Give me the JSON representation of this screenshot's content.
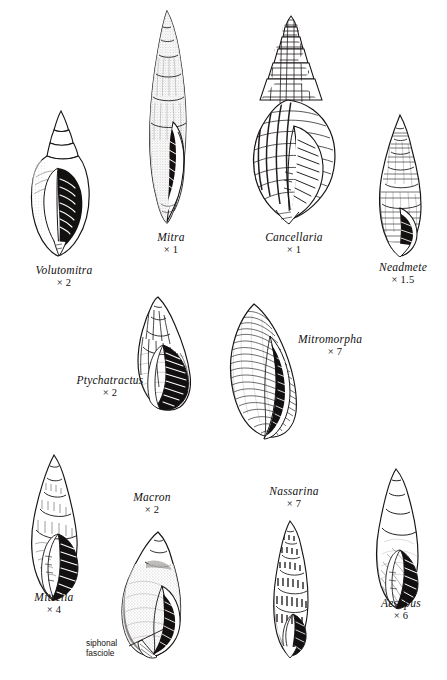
{
  "plate": {
    "title": "Gastropod shell plate",
    "background_color": "#ffffff",
    "ink_color": "#121010",
    "specimens": [
      {
        "genus": "Volutomitra",
        "magnification": "× 2",
        "caption_genus": "Volutomitra",
        "caption_mag": "× 2"
      },
      {
        "genus": "Mitra",
        "magnification": "× 1",
        "caption_genus": "Mitra",
        "caption_mag": "× 1"
      },
      {
        "genus": "Cancellaria",
        "magnification": "× 1",
        "caption_genus": "Cancellaria",
        "caption_mag": "× 1"
      },
      {
        "genus": "Neadmete",
        "magnification": "× 1.5",
        "caption_genus": "Neadmete",
        "caption_mag": "× 1.5"
      },
      {
        "genus": "Ptychatractus",
        "magnification": "× 2",
        "caption_genus": "Ptychatractus",
        "caption_mag": "× 2"
      },
      {
        "genus": "Mitromorpha",
        "magnification": "× 7",
        "caption_genus": "Mitromorpha",
        "caption_mag": "× 7"
      },
      {
        "genus": "Mitrella",
        "magnification": "× 4",
        "caption_genus": "Mitrella",
        "caption_mag": "× 4"
      },
      {
        "genus": "Macron",
        "magnification": "× 2",
        "caption_genus": "Macron",
        "caption_mag": "× 2"
      },
      {
        "genus": "Nassarina",
        "magnification": "× 7",
        "caption_genus": "Nassarina",
        "caption_mag": "× 7"
      },
      {
        "genus": "Aesopus",
        "magnification": "× 6",
        "caption_genus": "Aesopus",
        "caption_mag": "× 6"
      }
    ],
    "annotations": [
      {
        "line1": "siphonal",
        "line2": "fasciole"
      }
    ]
  }
}
